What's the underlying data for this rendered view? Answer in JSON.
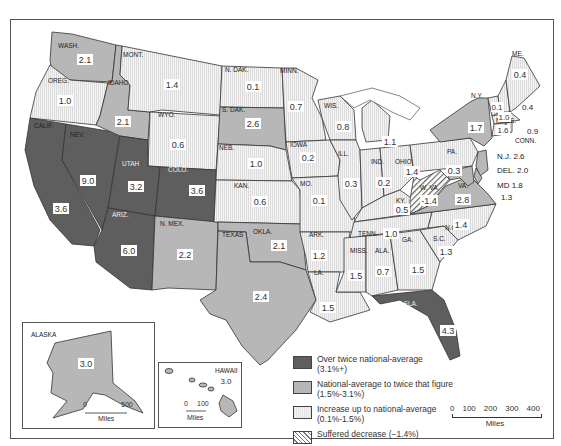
{
  "map": {
    "title": "",
    "fills": {
      "over_twice": "#5e5e5e",
      "national_to_twice": "#b7b7b7",
      "up_to_national": "#ededed",
      "decrease": "#ffffff"
    },
    "states": [
      {
        "abbr": "WASH.",
        "value": "2.1",
        "category": "national_to_twice"
      },
      {
        "abbr": "OREG.",
        "value": "1.0",
        "category": "up_to_national"
      },
      {
        "abbr": "CALIF.",
        "value": "3.6",
        "category": "over_twice"
      },
      {
        "abbr": "NEV.",
        "value": "9.0",
        "category": "over_twice"
      },
      {
        "abbr": "IDAHO",
        "value": "2.1",
        "category": "national_to_twice"
      },
      {
        "abbr": "MONT.",
        "value": "1.4",
        "category": "up_to_national"
      },
      {
        "abbr": "WYO.",
        "value": "0.6",
        "category": "up_to_national"
      },
      {
        "abbr": "UTAH",
        "value": "3.2",
        "category": "over_twice"
      },
      {
        "abbr": "COLO.",
        "value": "3.6",
        "category": "over_twice"
      },
      {
        "abbr": "ARIZ.",
        "value": "6.0",
        "category": "over_twice"
      },
      {
        "abbr": "N. MEX.",
        "value": "2.2",
        "category": "national_to_twice"
      },
      {
        "abbr": "N. DAK.",
        "value": "0.1",
        "category": "up_to_national"
      },
      {
        "abbr": "S. DAK.",
        "value": "2.6",
        "category": "national_to_twice"
      },
      {
        "abbr": "NEB.",
        "value": "1.0",
        "category": "up_to_national"
      },
      {
        "abbr": "KAN.",
        "value": "0.6",
        "category": "up_to_national"
      },
      {
        "abbr": "OKLA.",
        "value": "2.1",
        "category": "national_to_twice"
      },
      {
        "abbr": "TEXAS",
        "value": "2.4",
        "category": "national_to_twice"
      },
      {
        "abbr": "MINN.",
        "value": "0.7",
        "category": "up_to_national"
      },
      {
        "abbr": "IOWA",
        "value": "0.2",
        "category": "up_to_national"
      },
      {
        "abbr": "MO.",
        "value": "0.1",
        "category": "up_to_national"
      },
      {
        "abbr": "ARK.",
        "value": "1.2",
        "category": "up_to_national"
      },
      {
        "abbr": "LA.",
        "value": "1.5",
        "category": "up_to_national"
      },
      {
        "abbr": "WIS.",
        "value": "0.8",
        "category": "up_to_national"
      },
      {
        "abbr": "ILL.",
        "value": "0.3",
        "category": "up_to_national"
      },
      {
        "abbr": "MICH.",
        "value": "1.1",
        "category": "up_to_national"
      },
      {
        "abbr": "IND.",
        "value": "0.2",
        "category": "up_to_national"
      },
      {
        "abbr": "OHIO",
        "value": "1.4",
        "category": "up_to_national"
      },
      {
        "abbr": "KY.",
        "value": "0.5",
        "category": "up_to_national"
      },
      {
        "abbr": "TENN.",
        "value": "1.0",
        "category": "up_to_national"
      },
      {
        "abbr": "MISS.",
        "value": "1.5",
        "category": "up_to_national"
      },
      {
        "abbr": "ALA.",
        "value": "0.7",
        "category": "up_to_national"
      },
      {
        "abbr": "GA.",
        "value": "1.5",
        "category": "up_to_national"
      },
      {
        "abbr": "FLA.",
        "value": "4.3",
        "category": "over_twice"
      },
      {
        "abbr": "S.C.",
        "value": "1.3",
        "category": "up_to_national"
      },
      {
        "abbr": "N.C.",
        "value": "1.4",
        "category": "up_to_national"
      },
      {
        "abbr": "VA.",
        "value": "2.8",
        "category": "national_to_twice"
      },
      {
        "abbr": "W. VA.",
        "value": "-1.4",
        "category": "decrease"
      },
      {
        "abbr": "PA.",
        "value": "0.3",
        "category": "up_to_national"
      },
      {
        "abbr": "N.Y.",
        "value": "1.7",
        "category": "national_to_twice"
      },
      {
        "abbr": "VT.",
        "value": "0.1",
        "category": "up_to_national"
      },
      {
        "abbr": "N.H.",
        "value": "1.0",
        "category": "up_to_national"
      },
      {
        "abbr": "ME.",
        "value": "0.4",
        "category": "up_to_national"
      },
      {
        "abbr": "MASS.",
        "value": "1.6",
        "category": "national_to_twice"
      },
      {
        "abbr": "R.I.",
        "value": "0.4",
        "category": "up_to_national"
      },
      {
        "abbr": "CONN.",
        "value": "0.9",
        "category": "up_to_national"
      },
      {
        "abbr": "N.J.",
        "value": "2.6",
        "category": "national_to_twice"
      },
      {
        "abbr": "DEL.",
        "value": "2.0",
        "category": "national_to_twice"
      },
      {
        "abbr": "MD.",
        "value": "1.8",
        "category": "national_to_twice"
      },
      {
        "abbr": "D.C.",
        "value": "-1.3",
        "category": "decrease"
      },
      {
        "abbr": "ALASKA",
        "value": "3.0",
        "category": "national_to_twice"
      },
      {
        "abbr": "HAWAII",
        "value": "3.0",
        "category": "national_to_twice"
      }
    ],
    "labels": {
      "wash": "WASH.",
      "oreg": "OREG.",
      "calif": "CALIF.",
      "nev": "NEV.",
      "idaho": "IDAHO",
      "mont": "MONT.",
      "wyo": "WYO.",
      "utah": "UTAH",
      "colo": "COLO.",
      "ariz": "ARIZ.",
      "nmex": "N. MEX.",
      "ndak": "N. DAK.",
      "sdak": "S. DAK.",
      "neb": "NEB.",
      "kan": "KAN.",
      "okla": "OKLA.",
      "texas": "TEXAS",
      "minn": "MINN.",
      "iowa": "IOWA",
      "mo": "MO.",
      "ark": "ARK.",
      "la": "LA.",
      "wis": "WIS.",
      "ill": "ILL.",
      "ind": "IND.",
      "ohio": "OHIO",
      "ky": "KY.",
      "tenn": "TENN.",
      "miss": "MISS.",
      "ala": "ALA.",
      "ga": "GA.",
      "fla": "FLA.",
      "sc": "S.C.",
      "nc": "N.C.",
      "va": "VA.",
      "wva": "W. VA.",
      "pa": "PA.",
      "ny": "N.Y.",
      "me": "ME.",
      "mass": "MASS.",
      "conn": "CONN.",
      "nj": "N.J. 2.6",
      "del": "DEL. 2.0",
      "md": "MD 1.8",
      "dc": "1.3",
      "ri_val": "0.9",
      "nh_val": "0.4",
      "alaska": "ALASKA",
      "hawaii": "HAWAII"
    },
    "values": {
      "wash": "2.1",
      "oreg": "1.0",
      "calif": "3.6",
      "nev": "9.0",
      "idaho": "2.1",
      "mont": "1.4",
      "wyo": "0.6",
      "utah": "3.2",
      "colo": "3.6",
      "ariz": "6.0",
      "nmex": "2.2",
      "ndak": "0.1",
      "sdak": "2.6",
      "neb": "1.0",
      "kan": "0.6",
      "okla": "2.1",
      "texas": "2.4",
      "minn": "0.7",
      "iowa": "0.2",
      "mo": "0.1",
      "ark": "1.2",
      "la": "1.5",
      "wis": "0.8",
      "ill": "0.3",
      "mich": "1.1",
      "ind": "0.2",
      "ohio": "1.4",
      "ky": "0.5",
      "tenn": "1.0",
      "miss": "1.5",
      "ala": "0.7",
      "ga": "1.5",
      "fla": "4.3",
      "sc": "1.3",
      "nc": "1.4",
      "va": "2.8",
      "wva": "-1.4",
      "pa": "0.3",
      "ny": "1.7",
      "vt": "0.1",
      "nh": "1.0",
      "me": "0.4",
      "mass": "1.6",
      "alaska": "3.0",
      "hawaii": "3.0"
    }
  },
  "legend": {
    "items": [
      {
        "label": "Over twice national-average",
        "range": "(3.1%+)",
        "swatch": "dark-gray"
      },
      {
        "label": "National-average to twice that figure",
        "range": "(1.5%-3.1%)",
        "swatch": "medium-gray"
      },
      {
        "label": "Increase up to national-average",
        "range": "(0.1%-1.5%)",
        "swatch": "light-stipple"
      },
      {
        "label": "Suffered decrease (−1.4%)",
        "range": "",
        "swatch": "diagonal-hatch"
      }
    ]
  },
  "scale_main": {
    "ticks": [
      "0",
      "100",
      "200",
      "300",
      "400"
    ],
    "unit": "Miles"
  },
  "scale_alaska": {
    "ticks": [
      "0",
      "500"
    ],
    "unit": "Miles"
  },
  "scale_hawaii": {
    "ticks": [
      "0",
      "100"
    ],
    "unit": "Miles"
  }
}
